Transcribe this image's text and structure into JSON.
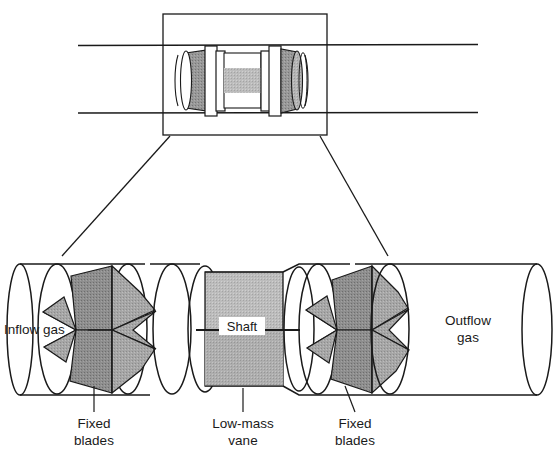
{
  "figure": {
    "type": "technical-cutaway-diagram",
    "views": [
      "overview-pipe-assembly",
      "magnified-cutaway"
    ]
  },
  "colors": {
    "background": "#ffffff",
    "outline": "#1a1a1a",
    "blade_fill": "#8e8e8e",
    "blade_fill_light": "#a8a8a8",
    "blade_fill_dark": "#757575",
    "shaft_fill": "#bcbcbc",
    "shaft_fill_dark": "#a9a9a9",
    "text": "#1a1a1a"
  },
  "overview": {
    "callout_box": {
      "x": 163,
      "y": 14,
      "width": 164,
      "height": 121
    },
    "pipe": {
      "top_y": 45,
      "bottom_y": 113,
      "left_x": 78,
      "right_x": 478
    }
  },
  "detail": {
    "labels": {
      "inflow_gas": "Inflow gas",
      "outflow_gas_line1": "Outflow",
      "outflow_gas_line2": "gas",
      "shaft": "Shaft",
      "fixed_blades_left_line1": "Fixed",
      "fixed_blades_left_line2": "blades",
      "fixed_blades_right_line1": "Fixed",
      "fixed_blades_right_line2": "blades",
      "low_mass_vane_line1": "Low-mass",
      "low_mass_vane_line2": "vane"
    }
  }
}
